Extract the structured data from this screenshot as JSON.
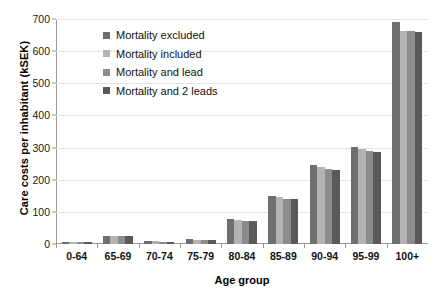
{
  "chart_data": {
    "type": "bar",
    "title": "",
    "xlabel": "Age group",
    "ylabel": "Care costs per inhabitant (kSEK)",
    "categories": [
      "0-64",
      "65-69",
      "70-74",
      "75-79",
      "80-84",
      "85-89",
      "90-94",
      "95-99",
      "100+"
    ],
    "series": [
      {
        "name": "Mortality excluded",
        "color": "#6f6f6f",
        "values": [
          6,
          26,
          8,
          15,
          78,
          150,
          245,
          303,
          690
        ]
      },
      {
        "name": "Mortality included",
        "color": "#b3b3b3",
        "values": [
          5,
          25,
          8,
          14,
          75,
          146,
          240,
          295,
          663
        ]
      },
      {
        "name": "Mortality and lead",
        "color": "#8c8c8c",
        "values": [
          5,
          24,
          7,
          13,
          73,
          141,
          232,
          288,
          662
        ]
      },
      {
        "name": "Mortality and 2 leads",
        "color": "#595959",
        "values": [
          5,
          24,
          7,
          13,
          72,
          139,
          229,
          285,
          661
        ]
      }
    ],
    "ylim": [
      0,
      700
    ],
    "yticks": [
      0,
      100,
      200,
      300,
      400,
      500,
      600,
      700
    ],
    "grid": true,
    "legend_position": "inside-top-left"
  },
  "axis": {
    "tick_labels": [
      "700",
      "600",
      "500",
      "400",
      "300",
      "200",
      "100",
      "0"
    ]
  }
}
